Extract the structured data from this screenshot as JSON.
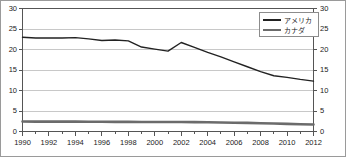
{
  "chart_data": {
    "type": "line",
    "title": "",
    "subtitle": "",
    "xlabel": "",
    "ylabel": "",
    "xlim": [
      1990,
      2012
    ],
    "ylim": [
      0,
      30
    ],
    "grid": true,
    "legend_position": "top-right",
    "dual_y_axis": true,
    "x": [
      1990,
      1991,
      1992,
      1993,
      1994,
      1995,
      1996,
      1997,
      1998,
      1999,
      2000,
      2001,
      2002,
      2003,
      2004,
      2005,
      2006,
      2007,
      2008,
      2009,
      2010,
      2011,
      2012
    ],
    "x_tick_labels": [
      "1990",
      "1992",
      "1994",
      "1996",
      "1998",
      "2000",
      "2002",
      "2004",
      "2006",
      "2008",
      "2010",
      "2012"
    ],
    "x_tick_values": [
      1990,
      1992,
      1994,
      1996,
      1998,
      2000,
      2002,
      2004,
      2006,
      2008,
      2010,
      2012
    ],
    "y_tick_labels_left": [
      "0",
      "5",
      "10",
      "15",
      "20",
      "25",
      "30"
    ],
    "y_tick_labels_right": [
      "0",
      "5",
      "10",
      "15",
      "20",
      "25",
      "30"
    ],
    "y_tick_values": [
      0,
      5,
      10,
      15,
      20,
      25,
      30
    ],
    "series": [
      {
        "name": "アメリカ",
        "color": "#222222",
        "width": 1.4,
        "values": [
          23.0,
          22.8,
          22.8,
          22.8,
          22.9,
          22.6,
          22.2,
          22.3,
          22.1,
          20.6,
          20.1,
          19.6,
          21.7,
          20.5,
          19.3,
          18.2,
          17.0,
          15.8,
          14.6,
          13.6,
          13.2,
          12.7,
          12.3
        ]
      },
      {
        "name": "カナダ",
        "color": "#6b6b6b",
        "width": 2.6,
        "values": [
          2.45,
          2.42,
          2.4,
          2.4,
          2.4,
          2.38,
          2.36,
          2.35,
          2.35,
          2.33,
          2.32,
          2.3,
          2.3,
          2.28,
          2.25,
          2.2,
          2.15,
          2.1,
          2.02,
          1.95,
          1.86,
          1.78,
          1.72
        ]
      }
    ]
  },
  "legend": {
    "entries": [
      {
        "label": "アメリカ",
        "style": "thin"
      },
      {
        "label": "カナダ",
        "style": "thick"
      }
    ]
  },
  "colors": {
    "border": "#8c8c8c",
    "gridline": "#c8c8c8",
    "axis": "#555555",
    "text": "#1a1a1a",
    "america_line": "#222222",
    "canada_line": "#6b6b6b",
    "background": "#ffffff"
  }
}
